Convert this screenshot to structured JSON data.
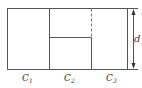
{
  "diagram": {
    "type": "capacitor-arrangement",
    "stroke_color": "#555555",
    "labels": {
      "c1": {
        "base": "C",
        "sub": "1"
      },
      "c2": {
        "base": "C",
        "sub": "2"
      },
      "c3": {
        "base": "C",
        "sub": "3"
      },
      "separation": "d"
    }
  }
}
